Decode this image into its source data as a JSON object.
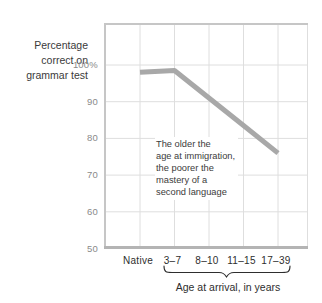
{
  "chart_data": {
    "type": "line",
    "categories": [
      "Native",
      "3–7",
      "8–10",
      "11–15",
      "17–39"
    ],
    "values": [
      98,
      98.5,
      91,
      83.5,
      76
    ],
    "ylim": [
      50,
      100
    ],
    "yticks": [
      {
        "value": 100,
        "label": "100%"
      },
      {
        "value": 90,
        "label": "90"
      },
      {
        "value": 80,
        "label": "80"
      },
      {
        "value": 70,
        "label": "70"
      },
      {
        "value": 60,
        "label": "60"
      },
      {
        "value": 50,
        "label": "50"
      }
    ],
    "ylabel_lines": [
      "Percentage",
      "correct on",
      "grammar test"
    ],
    "xlabel": "Age at arrival, in years",
    "annotation_lines": [
      "The older the",
      "age at immigration,",
      "the poorer the",
      "mastery of a",
      "second language"
    ],
    "grid": true,
    "legend": "none",
    "colors": {
      "line": "#a8a8a8",
      "grid": "#dedede",
      "bottom_axis": "#b4b4b4",
      "border": "#c6c6c6",
      "y_tick_text": "#8a8a8a",
      "x_tick_text": "#2e2e2e",
      "text": "#3a3a3a"
    }
  }
}
